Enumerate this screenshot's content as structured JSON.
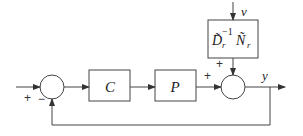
{
  "diagram": {
    "type": "block-diagram",
    "blocks": {
      "controller": {
        "label": "C"
      },
      "plant": {
        "label": "P"
      },
      "disturbance_filter": {
        "label_main": "D̃",
        "label_sub": "r",
        "label_sup": "−1",
        "label_main2": "Ñ",
        "label_sub2": "r"
      }
    },
    "signals": {
      "disturbance": "v",
      "output": "y"
    },
    "signs": {
      "left_sum_input": "+",
      "left_sum_feedback": "−",
      "right_sum_plant": "+",
      "right_sum_disturbance": "+"
    }
  }
}
